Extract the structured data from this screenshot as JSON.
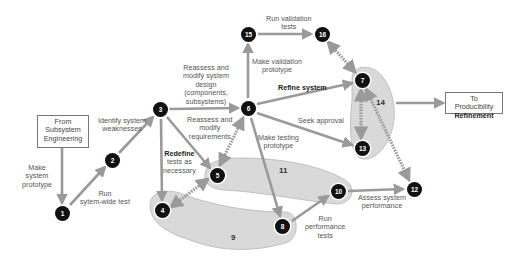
{
  "colors": {
    "arrow": "#9a9a9a",
    "group_fill": "#d9d9d9",
    "group_stroke": "#b5b5b5",
    "node_fill": "#111111",
    "node_text": "#ffffff",
    "label_text": "#555555"
  },
  "boxes": {
    "from": {
      "line1": "From",
      "line2": "Subsystem",
      "line3": "Engineering"
    },
    "to": {
      "line1": "To Producibility",
      "line2": "Refinement"
    }
  },
  "nodes": [
    {
      "id": "1",
      "label": "1"
    },
    {
      "id": "2",
      "label": "2"
    },
    {
      "id": "3",
      "label": "3"
    },
    {
      "id": "4",
      "label": "4"
    },
    {
      "id": "5",
      "label": "5"
    },
    {
      "id": "6",
      "label": "6"
    },
    {
      "id": "7",
      "label": "7"
    },
    {
      "id": "8",
      "label": "8"
    },
    {
      "id": "10",
      "label": "10"
    },
    {
      "id": "12",
      "label": "12"
    },
    {
      "id": "13",
      "label": "13"
    },
    {
      "id": "15",
      "label": "15"
    },
    {
      "id": "16",
      "label": "16"
    }
  ],
  "groups": {
    "g9": "9",
    "g11": "11",
    "g14": "14"
  },
  "labels": {
    "make_prototype": [
      "Make",
      "system",
      "prototype"
    ],
    "run_system_test": [
      "Run",
      "sytem-wide test"
    ],
    "identify_weakness": [
      "Identify system",
      "weaknesses"
    ],
    "reassess_design": [
      "Reassess and",
      "modify system",
      "design",
      "(components,",
      "subsystems)"
    ],
    "reassess_requirements": [
      "Reassess and",
      "modify",
      "requirements"
    ],
    "redefine_tests": [
      "Redefine",
      "tests as",
      "necessary"
    ],
    "run_validation": [
      "Run validation",
      "tests"
    ],
    "make_validation": [
      "Make validation",
      "prototype"
    ],
    "refine_system": "Refine system",
    "seek_approval": "Seek approval",
    "make_testing": [
      "Make testing",
      "prototype"
    ],
    "run_performance": [
      "Run",
      "performance",
      "tests"
    ],
    "assess_performance": [
      "Assess system",
      "performance"
    ]
  }
}
